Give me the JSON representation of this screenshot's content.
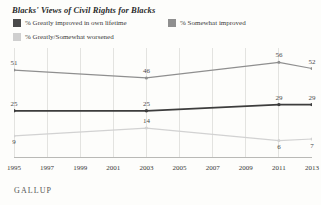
{
  "chart_title": "Blacks' Views of Civil Rights for Blacks",
  "source_logo": "GALLUP",
  "legend": {
    "position": "top",
    "items": [
      {
        "label": "% Greatly improved in own lifetime",
        "color": "#4a4a4a",
        "swatch": "legend-swatch-dark"
      },
      {
        "label": "% Somewhat improved",
        "color": "#8f8f8f",
        "swatch": "legend-swatch-mid"
      },
      {
        "label": "% Greatly/Somewhat worsened",
        "color": "#cfcfcf",
        "swatch": "legend-swatch-light"
      }
    ]
  },
  "chart_data": {
    "type": "line",
    "title": "Blacks' Views of Civil Rights for Blacks",
    "xlabel": "",
    "ylabel": "",
    "x": [
      1995,
      2003,
      2011,
      2013
    ],
    "categories": [
      "1995",
      "2003",
      "2011",
      "2013"
    ],
    "ylim": [
      0,
      60
    ],
    "xlim": [
      1995,
      2013
    ],
    "grid": true,
    "axis_ticks": [
      "1995",
      "1997",
      "1999",
      "2001",
      "2003",
      "2005",
      "2007",
      "2009",
      "2011",
      "2013"
    ],
    "series": [
      {
        "name": "% Somewhat improved",
        "color": "#8f8f8f",
        "values": [
          51,
          46,
          56,
          52
        ],
        "labels": [
          "51",
          "46",
          "56",
          "52"
        ]
      },
      {
        "name": "% Greatly improved in own lifetime",
        "color": "#3d3d3d",
        "values": [
          25,
          25,
          29,
          29
        ],
        "labels": [
          "25",
          "25",
          "29",
          "29"
        ]
      },
      {
        "name": "% Greatly/Somewhat worsened",
        "color": "#d2d2d2",
        "values": [
          9,
          14,
          6,
          7
        ],
        "labels": [
          "9",
          "14",
          "6",
          "7"
        ]
      }
    ]
  },
  "colors": {
    "background": "#fdfdfb",
    "gridline": "#e3e3e0",
    "axis": "#b9b9b6",
    "text": "#3a3a3a"
  }
}
